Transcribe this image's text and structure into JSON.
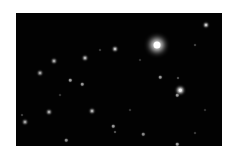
{
  "image": {
    "description": "Night sky starfield photo on white background",
    "background": "#ffffff",
    "field_color": "#020202",
    "field": {
      "x": 16,
      "y": 13,
      "width": 206,
      "height": 133
    }
  },
  "stars": [
    {
      "x": 157,
      "y": 45,
      "size": 7,
      "glow": 6,
      "color": "#ffffff"
    },
    {
      "x": 180,
      "y": 90,
      "size": 2.5,
      "glow": 3,
      "color": "#f2f2f2"
    },
    {
      "x": 177,
      "y": 95,
      "size": 1.5,
      "glow": 1,
      "color": "#9a9a9a"
    },
    {
      "x": 206,
      "y": 25,
      "size": 2,
      "glow": 2,
      "color": "#d0d0d0"
    },
    {
      "x": 115,
      "y": 49,
      "size": 2,
      "glow": 2,
      "color": "#c8c8c8"
    },
    {
      "x": 85,
      "y": 58,
      "size": 2,
      "glow": 2,
      "color": "#bdbdbd"
    },
    {
      "x": 54,
      "y": 61,
      "size": 2,
      "glow": 2,
      "color": "#b0b0b0"
    },
    {
      "x": 40,
      "y": 73,
      "size": 2,
      "glow": 2,
      "color": "#a8a8a8"
    },
    {
      "x": 70,
      "y": 80,
      "size": 1.5,
      "glow": 1,
      "color": "#a0a0a0"
    },
    {
      "x": 82,
      "y": 84,
      "size": 1.5,
      "glow": 1,
      "color": "#9a9a9a"
    },
    {
      "x": 160,
      "y": 77,
      "size": 1.5,
      "glow": 1,
      "color": "#9a9a9a"
    },
    {
      "x": 178,
      "y": 78,
      "size": 1,
      "glow": 1,
      "color": "#6a6a6a"
    },
    {
      "x": 49,
      "y": 112,
      "size": 2,
      "glow": 2,
      "color": "#b0b0b0"
    },
    {
      "x": 92,
      "y": 111,
      "size": 2,
      "glow": 2,
      "color": "#b8b8b8"
    },
    {
      "x": 25,
      "y": 122,
      "size": 2,
      "glow": 2,
      "color": "#a8a8a8"
    },
    {
      "x": 113,
      "y": 126,
      "size": 1.5,
      "glow": 1,
      "color": "#9a9a9a"
    },
    {
      "x": 115,
      "y": 132,
      "size": 1,
      "glow": 1,
      "color": "#707070"
    },
    {
      "x": 143,
      "y": 134,
      "size": 1.5,
      "glow": 1,
      "color": "#8a8a8a"
    },
    {
      "x": 66,
      "y": 140,
      "size": 1.5,
      "glow": 1,
      "color": "#909090"
    },
    {
      "x": 177,
      "y": 144,
      "size": 1.5,
      "glow": 1,
      "color": "#a0a0a0"
    },
    {
      "x": 195,
      "y": 45,
      "size": 1,
      "glow": 1,
      "color": "#5a5a5a"
    },
    {
      "x": 100,
      "y": 50,
      "size": 1,
      "glow": 1,
      "color": "#505050"
    },
    {
      "x": 22,
      "y": 115,
      "size": 1,
      "glow": 1,
      "color": "#555555"
    },
    {
      "x": 195,
      "y": 133,
      "size": 1,
      "glow": 1,
      "color": "#505050"
    },
    {
      "x": 130,
      "y": 110,
      "size": 1,
      "glow": 1,
      "color": "#4a4a4a"
    },
    {
      "x": 60,
      "y": 95,
      "size": 1,
      "glow": 1,
      "color": "#4a4a4a"
    },
    {
      "x": 140,
      "y": 60,
      "size": 1,
      "glow": 1,
      "color": "#454545"
    },
    {
      "x": 205,
      "y": 110,
      "size": 1,
      "glow": 1,
      "color": "#454545"
    }
  ]
}
